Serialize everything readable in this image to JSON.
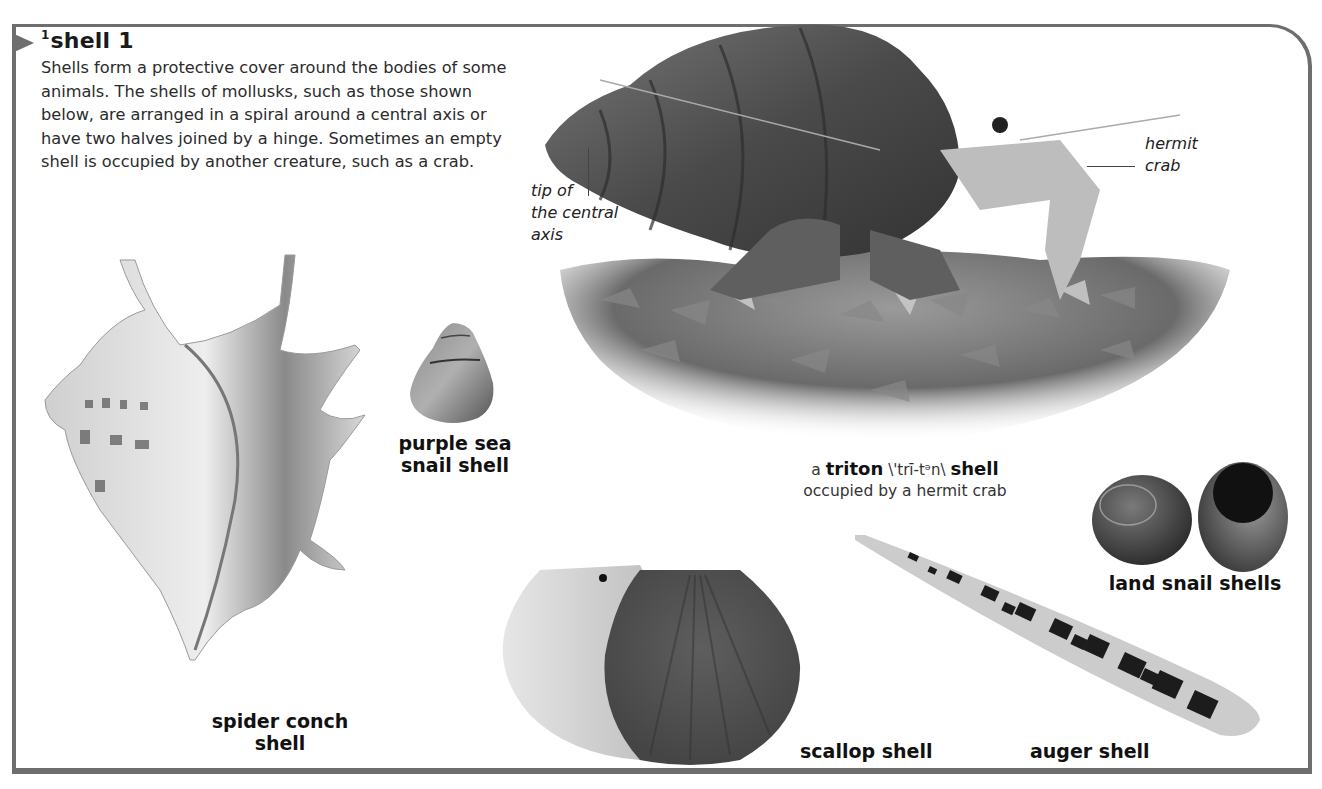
{
  "entry": {
    "superscript": "1",
    "headword": "shell",
    "sense_number": "1",
    "definition": "Shells form a protective cover around the bodies of some animals. The shells of mollusks, such as those shown below, are arranged in a spiral around a central axis or have two halves joined by a hinge. Sometimes an empty shell is occupied by another creature, such as a crab."
  },
  "illustrations": {
    "triton": {
      "caption_prefix": "a",
      "caption_term": "triton",
      "caption_pronunciation": "\\'trī-tᵊn\\",
      "caption_suffix": "shell",
      "caption_line2": "occupied by a hermit crab",
      "callout_tip": [
        "tip of",
        "the central",
        "axis"
      ],
      "callout_crab": [
        "hermit",
        "crab"
      ]
    },
    "spider_conch": {
      "label_line1": "spider conch",
      "label_line2": "shell"
    },
    "purple_sea_snail": {
      "label_line1": "purple sea",
      "label_line2": "snail shell"
    },
    "land_snail": {
      "label": "land snail shells"
    },
    "scallop": {
      "label": "scallop shell"
    },
    "auger": {
      "label": "auger shell"
    }
  },
  "colors": {
    "frame": "#6e6e6e",
    "text": "#1a1a1a",
    "background": "#ffffff"
  }
}
